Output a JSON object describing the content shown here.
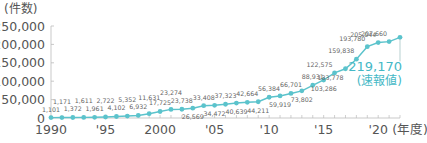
{
  "chart_data": {
    "type": "line",
    "title": "",
    "ylabel": "(件数)",
    "xlabel": "(年度)",
    "ylim": [
      0,
      250000
    ],
    "xlim": [
      1990,
      2022
    ],
    "yticks": [
      {
        "value": 0,
        "label": "0"
      },
      {
        "value": 50000,
        "label": "50,000"
      },
      {
        "value": 100000,
        "label": "100,000"
      },
      {
        "value": 150000,
        "label": "150,000"
      },
      {
        "value": 200000,
        "label": "200,000"
      },
      {
        "value": 250000,
        "label": "250,000"
      }
    ],
    "xticks": [
      {
        "value": 1990,
        "label": "1990"
      },
      {
        "value": 1995,
        "label": "'95"
      },
      {
        "value": 2000,
        "label": "2000"
      },
      {
        "value": 2005,
        "label": "'05"
      },
      {
        "value": 2010,
        "label": "'10"
      },
      {
        "value": 2015,
        "label": "'15"
      },
      {
        "value": 2020,
        "label": "'20"
      }
    ],
    "x": [
      1990,
      1991,
      1992,
      1993,
      1994,
      1995,
      1996,
      1997,
      1998,
      1999,
      2000,
      2001,
      2002,
      2003,
      2004,
      2005,
      2006,
      2007,
      2008,
      2009,
      2010,
      2011,
      2012,
      2013,
      2014,
      2015,
      2016,
      2017,
      2018,
      2019,
      2020,
      2021,
      2022
    ],
    "series": [
      {
        "name": "件数",
        "color": "#5bc3cc",
        "values": [
          1101,
          1171,
          1372,
          1611,
          1961,
          2722,
          4102,
          5352,
          6932,
          11631,
          17725,
          23274,
          23738,
          26569,
          33408,
          34472,
          37323,
          40639,
          42664,
          44211,
          56384,
          59919,
          66701,
          73802,
          88931,
          103286,
          122575,
          133778,
          159838,
          193780,
          205044,
          207660,
          219170
        ],
        "labels": [
          "1,101",
          "1,171",
          "1,372",
          "1,611",
          "1,961",
          "2,722",
          "4,102",
          "5,352",
          "6,932",
          "11,631",
          "17,725",
          "23,274",
          "23,738",
          "26,569",
          "33,408",
          "34,472",
          "37,323",
          "40,639",
          "42,664",
          "44,211",
          "56,384",
          "59,919",
          "66,701",
          "73,802",
          "88,931",
          "103,286",
          "122,575",
          "133,778",
          "159,838",
          "193,780",
          "205,044",
          "207,660",
          "219,170"
        ]
      }
    ],
    "highlight": {
      "year": 2022,
      "value_label": "219,170",
      "note": "(速報値)",
      "color": "#45b8c6"
    },
    "grid": false,
    "legend": "none"
  }
}
